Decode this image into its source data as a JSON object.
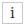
{
  "info_button": {
    "icon": "info-icon",
    "glyph": "i",
    "border_color": "#c8c8c8",
    "glyph_color": "#333333"
  }
}
